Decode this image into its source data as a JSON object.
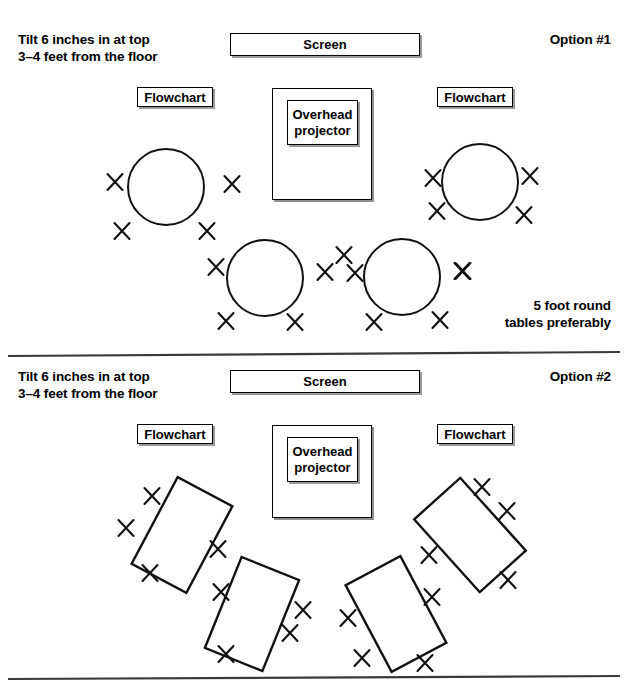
{
  "document": {
    "title": "Room setup options",
    "divider_color": "#3a3a3a"
  },
  "options": [
    {
      "id": "option-1",
      "label": "Option #1",
      "tilt_note_line1": "Tilt 6 inches in at top",
      "tilt_note_line2": "3–4 feet from the floor",
      "screen_label": "Screen",
      "projector_label_line1": "Overhead",
      "projector_label_line2": "projector",
      "flowchart_left_label": "Flowchart",
      "flowchart_right_label": "Flowchart",
      "footnote_line1": "5 foot round",
      "footnote_line2": "tables preferably",
      "table_shape": "circle",
      "table_count": 4,
      "seat_count": 18
    },
    {
      "id": "option-2",
      "label": "Option #2",
      "tilt_note_line1": "Tilt 6 inches in at top",
      "tilt_note_line2": "3–4 feet from the floor",
      "screen_label": "Screen",
      "projector_label_line1": "Overhead",
      "projector_label_line2": "projector",
      "flowchart_left_label": "Flowchart",
      "flowchart_right_label": "Flowchart",
      "footnote_line1": "",
      "footnote_line2": "",
      "table_shape": "rectangle",
      "table_count": 4,
      "seat_count": 16
    }
  ],
  "geometry": {
    "dividers": [
      {
        "name": "divider-middle",
        "x1": 8,
        "y1": 356,
        "x2": 620,
        "y2": 352
      },
      {
        "name": "divider-bottom",
        "x1": 8,
        "y1": 679,
        "x2": 620,
        "y2": 676
      }
    ],
    "option1": {
      "screen_box": {
        "x": 230,
        "y": 33,
        "w": 190,
        "h": 23
      },
      "flow_left": {
        "x": 137,
        "y": 87,
        "w": 76,
        "h": 20
      },
      "flow_right": {
        "x": 437,
        "y": 87,
        "w": 76,
        "h": 20
      },
      "proj_outer": {
        "x": 272,
        "y": 88,
        "w": 100,
        "h": 112
      },
      "proj_inner": {
        "x": 287,
        "y": 100,
        "w": 71,
        "h": 45
      },
      "circles": [
        {
          "cx": 166,
          "cy": 187,
          "r": 38
        },
        {
          "cx": 480,
          "cy": 182,
          "r": 38
        },
        {
          "cx": 265,
          "cy": 278,
          "r": 38
        },
        {
          "cx": 402,
          "cy": 277,
          "r": 38
        }
      ],
      "seats": [
        {
          "x": 115,
          "y": 182
        },
        {
          "x": 232,
          "y": 184
        },
        {
          "x": 122,
          "y": 231
        },
        {
          "x": 207,
          "y": 231
        },
        {
          "x": 433,
          "y": 178
        },
        {
          "x": 530,
          "y": 176
        },
        {
          "x": 437,
          "y": 211
        },
        {
          "x": 524,
          "y": 215
        },
        {
          "x": 216,
          "y": 267
        },
        {
          "x": 325,
          "y": 272
        },
        {
          "x": 226,
          "y": 321
        },
        {
          "x": 295,
          "y": 322
        },
        {
          "x": 344,
          "y": 255
        },
        {
          "x": 355,
          "y": 273
        },
        {
          "x": 463,
          "y": 271
        },
        {
          "x": 374,
          "y": 322
        },
        {
          "x": 440,
          "y": 320
        },
        {
          "x": 462,
          "y": 271
        }
      ]
    },
    "option2": {
      "screen_box": {
        "x": 230,
        "y": 370,
        "w": 190,
        "h": 23
      },
      "flow_left": {
        "x": 137,
        "y": 424,
        "w": 76,
        "h": 20
      },
      "flow_right": {
        "x": 437,
        "y": 424,
        "w": 76,
        "h": 20
      },
      "proj_outer": {
        "x": 272,
        "y": 425,
        "w": 100,
        "h": 93
      },
      "proj_inner": {
        "x": 287,
        "y": 437,
        "w": 71,
        "h": 45
      },
      "rects": [
        {
          "cx": 182,
          "cy": 535,
          "w": 62,
          "h": 98,
          "rot": 28
        },
        {
          "cx": 252,
          "cy": 614,
          "w": 62,
          "h": 98,
          "rot": 22
        },
        {
          "cx": 470,
          "cy": 535,
          "w": 62,
          "h": 98,
          "rot": -42
        },
        {
          "cx": 396,
          "cy": 614,
          "w": 62,
          "h": 98,
          "rot": -28
        }
      ],
      "seats": [
        {
          "x": 152,
          "y": 496
        },
        {
          "x": 126,
          "y": 528
        },
        {
          "x": 150,
          "y": 573
        },
        {
          "x": 218,
          "y": 549
        },
        {
          "x": 221,
          "y": 592
        },
        {
          "x": 303,
          "y": 610
        },
        {
          "x": 226,
          "y": 654
        },
        {
          "x": 290,
          "y": 633
        },
        {
          "x": 482,
          "y": 487
        },
        {
          "x": 507,
          "y": 511
        },
        {
          "x": 429,
          "y": 555
        },
        {
          "x": 508,
          "y": 580
        },
        {
          "x": 348,
          "y": 618
        },
        {
          "x": 432,
          "y": 597
        },
        {
          "x": 362,
          "y": 658
        },
        {
          "x": 425,
          "y": 663
        }
      ]
    }
  }
}
